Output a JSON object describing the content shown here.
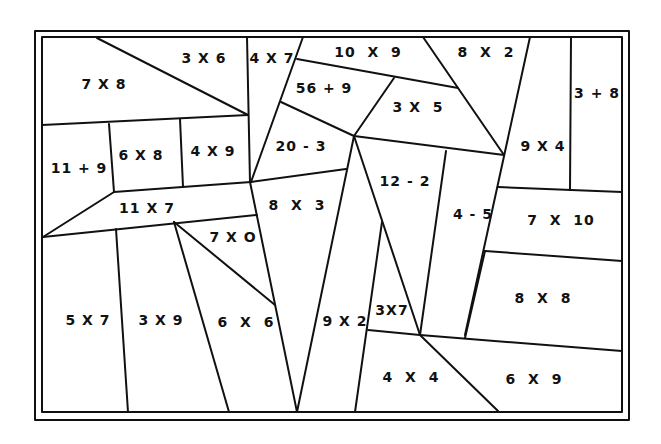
{
  "worksheet": {
    "colors": {
      "line": "#111111",
      "background": "#ffffff"
    },
    "regions": [
      {
        "id": "r1",
        "expr": "7 X 8",
        "x": 104,
        "y": 84
      },
      {
        "id": "r2",
        "expr": "3 X 6",
        "x": 204,
        "y": 58
      },
      {
        "id": "r3",
        "expr": "4 X 7",
        "x": 272,
        "y": 58
      },
      {
        "id": "r4",
        "expr": "10  X  9",
        "x": 368,
        "y": 52
      },
      {
        "id": "r5",
        "expr": "8  X  2",
        "x": 486,
        "y": 52
      },
      {
        "id": "r6",
        "expr": "3 + 8",
        "x": 597,
        "y": 93
      },
      {
        "id": "r7",
        "expr": "56 + 9",
        "x": 324,
        "y": 88
      },
      {
        "id": "r8",
        "expr": "3 X  5",
        "x": 418,
        "y": 107
      },
      {
        "id": "r9",
        "expr": "11 + 9",
        "x": 79,
        "y": 168
      },
      {
        "id": "r10",
        "expr": "6 X 8",
        "x": 141,
        "y": 155
      },
      {
        "id": "r11",
        "expr": "4 X 9",
        "x": 213,
        "y": 151
      },
      {
        "id": "r12",
        "expr": "20 - 3",
        "x": 301,
        "y": 146
      },
      {
        "id": "r13",
        "expr": "9 X 4",
        "x": 543,
        "y": 146
      },
      {
        "id": "r14",
        "expr": "12 - 2",
        "x": 405,
        "y": 181
      },
      {
        "id": "r15",
        "expr": "11 X 7",
        "x": 147,
        "y": 208
      },
      {
        "id": "r16",
        "expr": "8  X  3",
        "x": 297,
        "y": 205
      },
      {
        "id": "r17",
        "expr": "4 - 5",
        "x": 473,
        "y": 214
      },
      {
        "id": "r18",
        "expr": "7  X  10",
        "x": 561,
        "y": 220
      },
      {
        "id": "r19",
        "expr": "7 X O",
        "x": 233,
        "y": 237
      },
      {
        "id": "r20",
        "expr": "5 X 7",
        "x": 88,
        "y": 320
      },
      {
        "id": "r21",
        "expr": "3 X 9",
        "x": 161,
        "y": 320
      },
      {
        "id": "r22",
        "expr": "6  X  6",
        "x": 246,
        "y": 322
      },
      {
        "id": "r23",
        "expr": "9 X 2",
        "x": 345,
        "y": 321
      },
      {
        "id": "r24",
        "expr": "3X7",
        "x": 392,
        "y": 310
      },
      {
        "id": "r25",
        "expr": "8  X  8",
        "x": 543,
        "y": 298
      },
      {
        "id": "r26",
        "expr": "4  X  4",
        "x": 411,
        "y": 377
      },
      {
        "id": "r27",
        "expr": "6  X  9",
        "x": 534,
        "y": 379
      }
    ]
  }
}
